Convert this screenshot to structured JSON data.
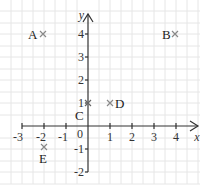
{
  "diagram": {
    "type": "coordinate-grid",
    "axes": {
      "x_label": "x",
      "y_label": "y",
      "x_ticks": [
        "-3",
        "-2",
        "-1",
        "1",
        "2",
        "3",
        "4"
      ],
      "y_ticks": [
        "4",
        "3",
        "2",
        "1",
        "-1",
        "-2"
      ],
      "origin_label": "0",
      "x_range": [
        -3,
        4
      ],
      "y_range": [
        -2,
        4
      ]
    },
    "points": [
      {
        "label": "A",
        "x": -2,
        "y": 4
      },
      {
        "label": "B",
        "x": 4,
        "y": 4
      },
      {
        "label": "C",
        "x": 0,
        "y": 1
      },
      {
        "label": "D",
        "x": 1,
        "y": 1
      },
      {
        "label": "E",
        "x": -2,
        "y": -0.5
      }
    ],
    "colors": {
      "grid": "#e6e6e6",
      "axis": "#333333",
      "marker": "#888888",
      "text": "#222222"
    }
  }
}
